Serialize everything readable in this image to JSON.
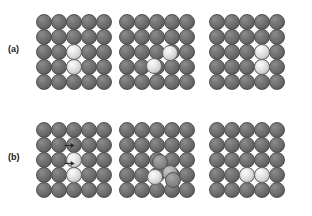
{
  "figure": {
    "rows": [
      {
        "id": "a",
        "label": "(a)",
        "caption": "Hopping mechanism: adatom dimer translates across the surface",
        "panels": [
          {
            "index": 1,
            "name": "initial-state",
            "lattice": {
              "type": "square",
              "rows": 5,
              "cols": 5
            },
            "substrate_atom_color": "#6a6a6a",
            "adatom_color": "#e8e8e8",
            "adatoms": [
              {
                "col": 2,
                "row": 2,
                "shade": "light",
                "offset_x": 0,
                "offset_y": 0
              },
              {
                "col": 2,
                "row": 3,
                "shade": "light",
                "offset_x": 0,
                "offset_y": 0
              }
            ],
            "arrows": []
          },
          {
            "index": 2,
            "name": "transition-state",
            "lattice": {
              "type": "square",
              "rows": 5,
              "cols": 5
            },
            "substrate_atom_color": "#6a6a6a",
            "adatom_color": "#e8e8e8",
            "adatoms": [
              {
                "col": 3,
                "row": 2,
                "shade": "light",
                "offset_x": -2,
                "offset_y": 1
              },
              {
                "col": 2,
                "row": 3,
                "shade": "light",
                "offset_x": -3,
                "offset_y": -1
              }
            ],
            "arrows": []
          },
          {
            "index": 3,
            "name": "final-state",
            "lattice": {
              "type": "square",
              "rows": 5,
              "cols": 5
            },
            "substrate_atom_color": "#6a6a6a",
            "adatom_color": "#e8e8e8",
            "adatoms": [
              {
                "col": 3,
                "row": 2,
                "shade": "light",
                "offset_x": 0,
                "offset_y": 0
              },
              {
                "col": 3,
                "row": 3,
                "shade": "light",
                "offset_x": 0,
                "offset_y": 0
              }
            ],
            "arrows": []
          }
        ]
      },
      {
        "id": "b",
        "label": "(b)",
        "caption": "Exchange mechanism: adatoms rotate through a concerted intermediate",
        "panels": [
          {
            "index": 1,
            "name": "initial-state",
            "lattice": {
              "type": "square",
              "rows": 5,
              "cols": 5
            },
            "substrate_atom_color": "#6a6a6a",
            "adatom_color": "#e8e8e8",
            "adatoms": [
              {
                "col": 2,
                "row": 2,
                "shade": "light",
                "offset_x": 0,
                "offset_y": 0
              },
              {
                "col": 2,
                "row": 3,
                "shade": "light",
                "offset_x": 0,
                "offset_y": 0
              }
            ],
            "arrows": [
              {
                "name": "motion-arrow-upper",
                "x": 29,
                "y": 20,
                "direction": "right"
              },
              {
                "name": "motion-arrow-lower",
                "x": 29,
                "y": 38,
                "direction": "right"
              }
            ]
          },
          {
            "index": 2,
            "name": "transition-state",
            "lattice": {
              "type": "square",
              "rows": 5,
              "cols": 5
            },
            "substrate_atom_color": "#6a6a6a",
            "adatom_color": "#e8e8e8",
            "adatoms": [
              {
                "col": 2,
                "row": 2,
                "shade": "mid2",
                "offset_x": 3,
                "offset_y": 2
              },
              {
                "col": 3,
                "row": 3,
                "shade": "mid",
                "offset_x": -2,
                "offset_y": -2
              },
              {
                "col": 2,
                "row": 3,
                "shade": "light",
                "offset_x": -2,
                "offset_y": 2
              },
              {
                "col": 3,
                "row": 3,
                "shade": "mid2",
                "offset_x": 1,
                "offset_y": 5
              }
            ],
            "arrows": []
          },
          {
            "index": 3,
            "name": "final-state",
            "lattice": {
              "type": "square",
              "rows": 5,
              "cols": 5
            },
            "substrate_atom_color": "#6a6a6a",
            "adatom_color": "#e8e8e8",
            "adatoms": [
              {
                "col": 2,
                "row": 3,
                "shade": "light",
                "offset_x": 0,
                "offset_y": 0
              },
              {
                "col": 3,
                "row": 3,
                "shade": "light",
                "offset_x": 0,
                "offset_y": 0
              }
            ],
            "arrows": []
          }
        ]
      }
    ],
    "colors": {
      "background": "#ffffff",
      "substrate": "#6a6a6a",
      "adatom": "#e8e8e8",
      "intermediate": "#9a9a9a",
      "label_text": "#1a1a1a",
      "arrow": "#2b2b2b"
    }
  }
}
